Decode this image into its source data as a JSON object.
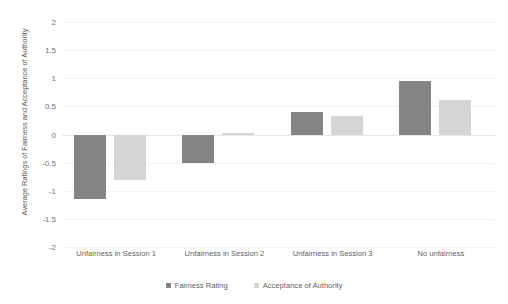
{
  "chart_data": {
    "type": "bar",
    "title": "",
    "xlabel": "",
    "ylabel": "Average Ratings of Fairness and Acceptance of Authority",
    "ylim": [
      -2,
      2
    ],
    "ytick_values": [
      2,
      1.5,
      1,
      0.5,
      0,
      -0.5,
      -1,
      -1.5,
      -2
    ],
    "ytick_labels": [
      "2",
      "1.5",
      "1",
      "0.5",
      "0",
      "-0.5",
      "-1",
      "-1.5",
      "-2"
    ],
    "grid": true,
    "legend_position": "bottom",
    "categories": [
      "Unfairness in Session 1",
      "Unfairness in Session 2",
      "Unfairness in Session 3",
      "No unfairness"
    ],
    "series": [
      {
        "name": "Fairness Rating",
        "color": "#848484",
        "values": [
          -1.15,
          -0.5,
          0.4,
          0.95
        ]
      },
      {
        "name": "Acceptance of Authority",
        "color": "#d5d5d5",
        "values": [
          -0.8,
          0.03,
          0.33,
          0.62
        ]
      }
    ]
  },
  "axes": {
    "y_title": "Average Ratings of Fairness and Acceptance of Authority"
  },
  "legend": {
    "items": [
      {
        "label": "Fairness Rating"
      },
      {
        "label": "Acceptance of Authority"
      }
    ]
  },
  "colors": {
    "series_fairness": "#848484",
    "series_acceptance": "#d5d5d5",
    "gridline": "#f2f2f2",
    "text": "#5f5f5f",
    "background": "#ffffff"
  }
}
